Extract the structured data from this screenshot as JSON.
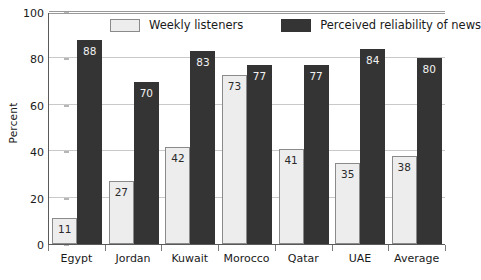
{
  "chart_data": {
    "type": "bar",
    "title": "",
    "xlabel": "",
    "ylabel": "Percent",
    "ylim": [
      0,
      100
    ],
    "yticks": [
      0,
      20,
      40,
      60,
      80,
      100
    ],
    "grid": true,
    "legend_position": "top-center",
    "categories": [
      "Egypt",
      "Jordan",
      "Kuwait",
      "Morocco",
      "Qatar",
      "UAE",
      "Average"
    ],
    "series": [
      {
        "name": "Weekly listeners",
        "color": "#ededed",
        "values": [
          11,
          27,
          42,
          73,
          41,
          35,
          38
        ]
      },
      {
        "name": "Perceived reliability of news",
        "color": "#343434",
        "values": [
          88,
          70,
          83,
          77,
          77,
          84,
          80
        ]
      }
    ]
  },
  "legend": {
    "items": [
      {
        "label": "Weekly listeners",
        "swatch": "light"
      },
      {
        "label": "Perceived reliability of news",
        "swatch": "dark"
      }
    ]
  }
}
